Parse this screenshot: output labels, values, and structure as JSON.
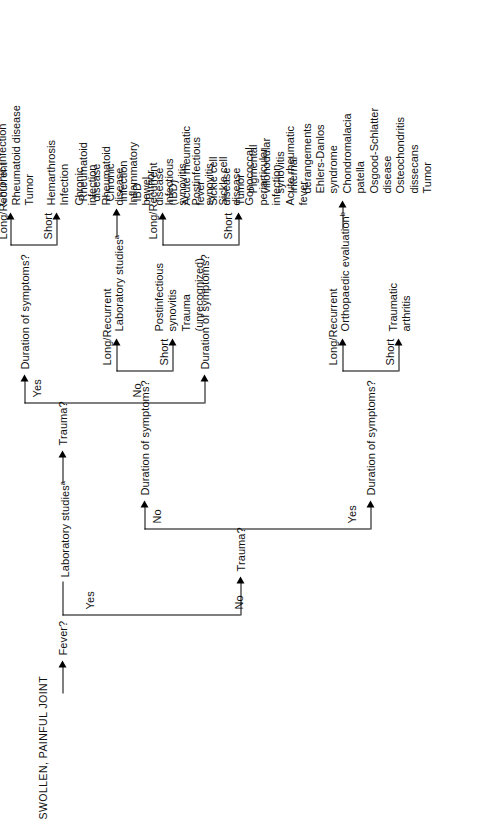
{
  "diagram": {
    "root_label": "SWOLLEN, PAINFUL JOINT",
    "decision_fever": "Fever?",
    "branch_fever_yes": "Yes",
    "branch_fever_no": "No",
    "lab_studies_left": "Laboratory studies",
    "lab_studies_left_sup": "a",
    "decision_trauma_left": "Trauma?",
    "trauma_left_yes": "Yes",
    "trauma_left_no": "No",
    "duration_q": "Duration of symptoms?",
    "short": "Short",
    "long_recurrent": "Long/Recurrent",
    "decision_trauma_right": "Trauma?",
    "trauma_right_yes": "Yes",
    "trauma_right_no": "No",
    "ortho_eval": "Orthopaedic evaluation",
    "ortho_eval_sup": "b",
    "lab_studies_right": "Laboratory studies",
    "lab_studies_right_sup": "a",
    "outcomes": {
      "fever_yes_trauma_yes_short": [
        "Hemarthrosis",
        "Infection"
      ],
      "fever_yes_trauma_yes_long": [
        "Hemophilia",
        "Chronic infection",
        "Rheumatoid disease",
        "Tumor"
      ],
      "fever_yes_trauma_no_short": [
        "Infectious",
        "synovitis",
        "Postinfectious",
        "synovitis",
        "Sickle cell",
        "disease",
        "Gonococcal",
        "periarticular",
        "infection",
        "Acute rheumatic",
        "fever"
      ],
      "fever_yes_trauma_no_long": [
        "Chronic",
        "infection",
        "Rheumatoid",
        "disease",
        "Inflammatory",
        "bowel",
        "disease",
        "(IBD)",
        "Acute rheumatic",
        "fever",
        "Sickle cell",
        "disease",
        "Tumor"
      ],
      "fever_no_trauma_yes_short": [
        "Traumatic",
        "arthritis"
      ],
      "fever_no_trauma_yes_long": [
        "Pigmental",
        "villonodular",
        "synovitis",
        "Internal",
        "derangements",
        "Ehlers-Danlos",
        "syndrome",
        "Chondromalacia",
        "patella",
        "Osgood-Schlatter",
        "disease",
        "Osteochondritis",
        "dissecans",
        "Tumor"
      ],
      "fever_no_trauma_no_short": [
        "Postinfectious",
        "synovitis",
        "Trauma",
        "(unrecognized)"
      ],
      "fever_no_trauma_no_long": [
        "Rheumatoid",
        "disease",
        "Chronic",
        "infection",
        "IBD",
        "Tumor"
      ]
    }
  }
}
